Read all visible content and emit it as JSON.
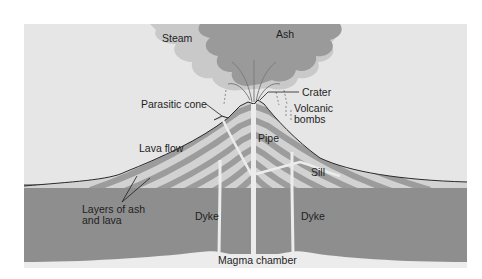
{
  "diagram": {
    "labels": {
      "steam": "Steam",
      "ash": "Ash",
      "crater": "Crater",
      "parasitic_cone": "Parasitic cone",
      "volcanic_bombs_1": "Volcanic",
      "volcanic_bombs_2": "bombs",
      "pipe": "Pipe",
      "lava_flow": "Lava flow",
      "sill": "Sill",
      "layers_1": "Layers of ash",
      "layers_2": "and lava",
      "dyke_left": "Dyke",
      "dyke_right": "Dyke",
      "magma_chamber": "Magma chamber"
    },
    "colors": {
      "sky": "#e6e6e6",
      "steam_cloud": "#c9c9c9",
      "ash_cloud": "#9a9a9a",
      "ground": "#8e8e8e",
      "layer_dark": "#9c9c9c",
      "layer_light": "#d2d2d2",
      "magma": "#ececec",
      "outline": "#2a2a2a",
      "text": "#1e1e1e"
    }
  }
}
